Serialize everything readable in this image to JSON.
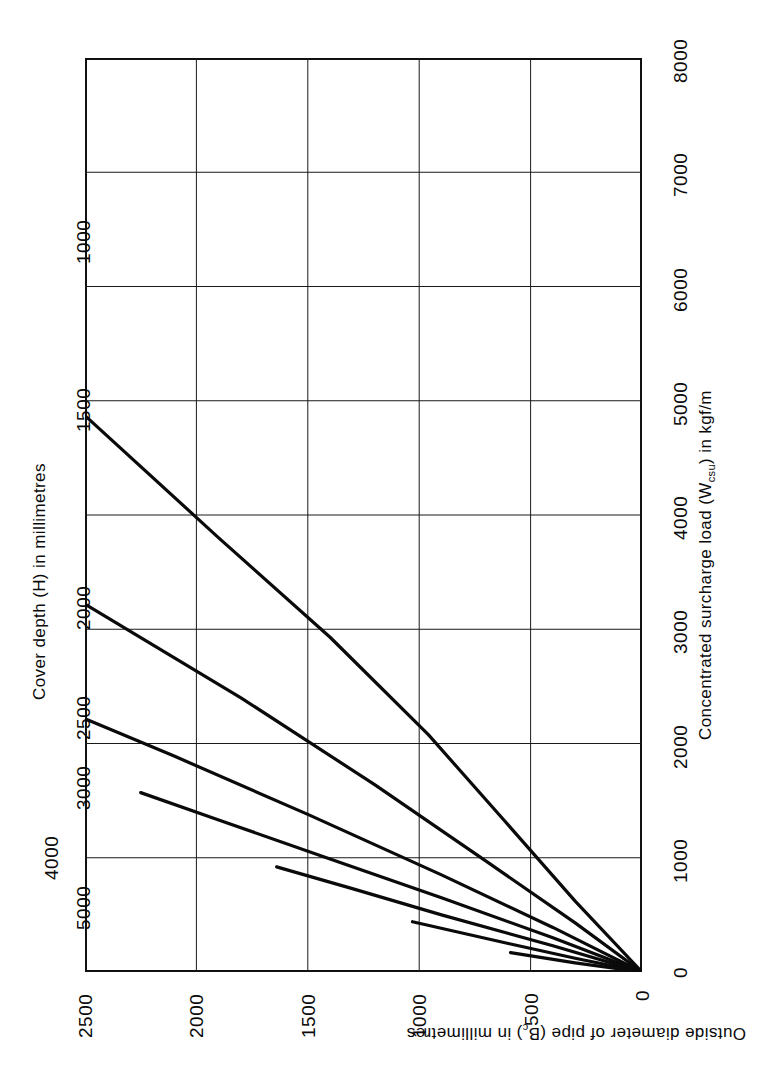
{
  "figure": {
    "caption_line1": "Concentrated surcharge loading—fields, gardens and lightly trafficked access roads. Impact factor 2·0, Class B",
    "caption_line2": "bedding or concrete arch."
  },
  "chart_data": {
    "type": "line",
    "title": "",
    "orientation": "rotated-90ccw",
    "xlabel": "Concentrated surcharge load (Wcsu) in kgf/m",
    "ylabel": "Outside diameter of pipe (Bc) in millimetres",
    "series_label": "Cover depth (H) in millimetres",
    "xlim": [
      0,
      8000
    ],
    "ylim": [
      0,
      2500
    ],
    "xticks": [
      0,
      1000,
      2000,
      3000,
      4000,
      5000,
      6000,
      7000,
      8000
    ],
    "xtick_labels": [
      "0",
      "1000",
      "2000",
      "3000",
      "4000",
      "5000",
      "6000",
      "7000",
      "8000"
    ],
    "yticks": [
      0,
      500,
      1000,
      1500,
      2000,
      2500
    ],
    "ytick_labels": [
      "0",
      "500",
      "1000",
      "1500",
      "2000",
      "2500"
    ],
    "grid": true,
    "legend": "inline-curve-labels",
    "series": [
      {
        "name": "1000",
        "label": "1000",
        "cover_depth_mm": 1000,
        "points": [
          [
            0,
            0
          ],
          [
            300,
            620
          ],
          [
            620,
            1330
          ],
          [
            960,
            2080
          ],
          [
            1400,
            2930
          ],
          [
            1900,
            3800
          ],
          [
            2500,
            4870
          ],
          [
            3200,
            5960
          ],
          [
            3900,
            6890
          ],
          [
            4600,
            7650
          ],
          [
            5300,
            8200
          ],
          [
            6000,
            8550
          ],
          [
            6420,
            8650
          ]
        ]
      },
      {
        "name": "1500",
        "label": "1500",
        "cover_depth_mm": 1500,
        "points": [
          [
            0,
            0
          ],
          [
            300,
            430
          ],
          [
            700,
            970
          ],
          [
            1200,
            1640
          ],
          [
            1800,
            2400
          ],
          [
            2500,
            3220
          ],
          [
            3200,
            3960
          ],
          [
            3900,
            4600
          ],
          [
            4500,
            5080
          ],
          [
            4950,
            5400
          ]
        ]
      },
      {
        "name": "2000",
        "label": "2000",
        "cover_depth_mm": 2000,
        "points": [
          [
            0,
            0
          ],
          [
            400,
            390
          ],
          [
            900,
            850
          ],
          [
            1500,
            1380
          ],
          [
            2100,
            1890
          ],
          [
            2700,
            2380
          ],
          [
            3210,
            2790
          ]
        ]
      },
      {
        "name": "2500",
        "label": "2500",
        "cover_depth_mm": 2500,
        "points": [
          [
            0,
            0
          ],
          [
            400,
            300
          ],
          [
            900,
            650
          ],
          [
            1400,
            990
          ],
          [
            1900,
            1330
          ],
          [
            2250,
            1570
          ]
        ]
      },
      {
        "name": "3000",
        "label": "3000",
        "cover_depth_mm": 3000,
        "points": [
          [
            0,
            0
          ],
          [
            400,
            230
          ],
          [
            900,
            500
          ],
          [
            1300,
            730
          ],
          [
            1640,
            920
          ]
        ]
      },
      {
        "name": "4000",
        "label": "4000",
        "cover_depth_mm": 4000,
        "points": [
          [
            0,
            0
          ],
          [
            300,
            120
          ],
          [
            600,
            250
          ],
          [
            1030,
            440
          ]
        ]
      },
      {
        "name": "5000",
        "label": "5000",
        "cover_depth_mm": 5000,
        "points": [
          [
            0,
            0
          ],
          [
            300,
            80
          ],
          [
            590,
            170
          ]
        ]
      }
    ],
    "curve_start_values": {
      "note": "Value of Wcsu (kgf/m) where each cover-depth curve meets Bc = 2500 mm",
      "1000": 6420,
      "1500": 4950,
      "2000": 3210,
      "2500": 2250,
      "3000": 1640,
      "4000": 1030,
      "5000": 590
    }
  }
}
